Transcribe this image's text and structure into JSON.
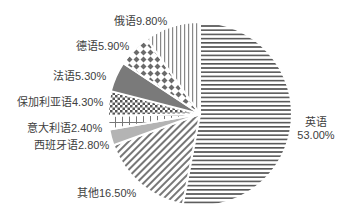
{
  "chart_data": {
    "type": "pie",
    "title": "",
    "start_angle_deg": 0,
    "direction": "clockwise",
    "slices": [
      {
        "label": "英语",
        "value": 53.0,
        "display": "53.00%",
        "pattern": "horizontal-lines"
      },
      {
        "label": "其他",
        "value": 16.5,
        "display": "16.50%",
        "pattern": "diagonal-lines"
      },
      {
        "label": "西班牙语",
        "value": 2.8,
        "display": "2.80%",
        "pattern": "solid-light"
      },
      {
        "label": "意大利语",
        "value": 2.4,
        "display": "2.40%",
        "pattern": "crosses"
      },
      {
        "label": "保加利亚语",
        "value": 4.3,
        "display": "4.30%",
        "pattern": "checker"
      },
      {
        "label": "法语",
        "value": 5.3,
        "display": "5.30%",
        "pattern": "solid-dark"
      },
      {
        "label": "德语",
        "value": 5.9,
        "display": "5.90%",
        "pattern": "diamonds"
      },
      {
        "label": "俄语",
        "value": 9.8,
        "display": "9.80%",
        "pattern": "vertical-lines"
      }
    ],
    "legend": "none",
    "data_labels": "outside"
  },
  "labels": {
    "english_name": "英语",
    "english_pct": "53.00%",
    "other": "其他16.50%",
    "spanish": "西班牙语2.80%",
    "italian": "意大利语2.40%",
    "bulgarian": "保加利亚语4.30%",
    "french": "法语5.30%",
    "german": "德语5.90%",
    "russian": "俄语9.80%"
  },
  "colors": {
    "pattern_stroke": "#6e6e6e",
    "solid_light": "#b4b4b4",
    "solid_dark": "#7a7a7a",
    "label_text": "#404040"
  }
}
